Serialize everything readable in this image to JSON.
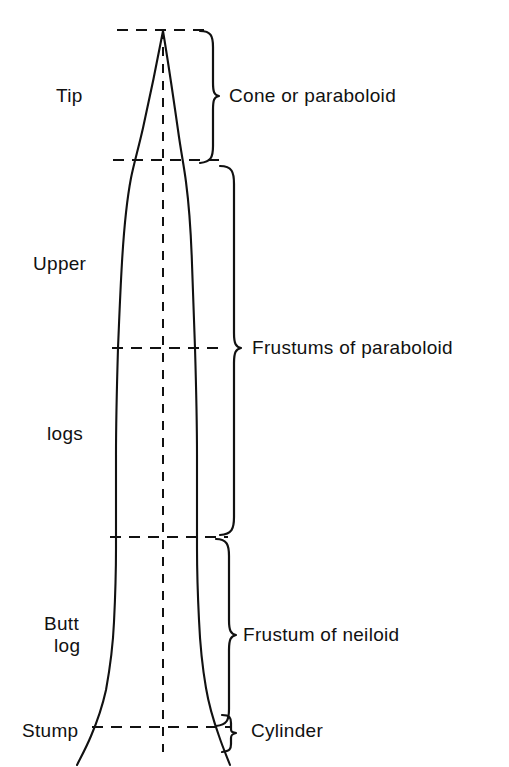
{
  "figure": {
    "type": "tree-stem-form-diagram",
    "title": "",
    "background_color": "#ffffff",
    "line_color": "#111111",
    "stem": {
      "apex_x": 163,
      "apex_y": 30,
      "center_line_x": 163,
      "base_y": 767
    },
    "section_lines": [
      {
        "name": "tip-top",
        "y": 30,
        "x_start": 117,
        "x_end": 212
      },
      {
        "name": "tip-bottom",
        "y": 160,
        "x_start": 113,
        "x_end": 224
      },
      {
        "name": "upper-mid",
        "y": 348,
        "x_start": 112,
        "x_end": 226
      },
      {
        "name": "upper-bottom",
        "y": 537,
        "x_start": 110,
        "x_end": 228
      },
      {
        "name": "stump-line",
        "y": 727,
        "x_start": 92,
        "x_end": 230
      }
    ]
  },
  "left_labels": [
    {
      "id": "tip",
      "text": "Tip",
      "x": 56,
      "y": 85
    },
    {
      "id": "upper",
      "text": "Upper",
      "x": 33,
      "y": 253
    },
    {
      "id": "logs",
      "text": "logs",
      "x": 47,
      "y": 423
    },
    {
      "id": "butt-log-line1",
      "text": "Butt",
      "x": 44,
      "y": 613
    },
    {
      "id": "butt-log-line2",
      "text": "log",
      "x": 54,
      "y": 635
    },
    {
      "id": "stump",
      "text": "Stump",
      "x": 22,
      "y": 720
    }
  ],
  "right_labels": [
    {
      "id": "cone-or-paraboloid",
      "text": "Cone or paraboloid",
      "x": 229,
      "y": 85,
      "brace_top": 30,
      "brace_bottom": 163,
      "brace_tip_y": 96,
      "brace_x": 200
    },
    {
      "id": "frustums-of-paraboloid",
      "text": "Frustums of paraboloid",
      "x": 252,
      "y": 337,
      "brace_top": 165,
      "brace_bottom": 535,
      "brace_tip_y": 348,
      "brace_x": 220
    },
    {
      "id": "frustum-of-neiloid",
      "text": "Frustum of neiloid",
      "x": 243,
      "y": 624,
      "brace_top": 538,
      "brace_bottom": 726,
      "brace_tip_y": 635,
      "brace_x": 216
    },
    {
      "id": "cylinder",
      "text": "Cylinder",
      "x": 251,
      "y": 720,
      "brace_top": 714,
      "brace_bottom": 752,
      "brace_tip_y": 733,
      "brace_x": 222
    }
  ],
  "colors": {
    "ink": "#111111",
    "paper": "#ffffff"
  }
}
